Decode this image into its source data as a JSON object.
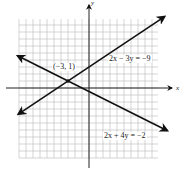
{
  "chart_data": {
    "type": "line",
    "title": "",
    "xlabel": "x",
    "ylabel": "y",
    "grid": true,
    "xlim": [
      -10,
      10
    ],
    "ylim": [
      -10,
      10
    ],
    "series": [
      {
        "name": "2x − 3y = −9",
        "equation": "2x - 3y = -9",
        "slope": 0.6667,
        "intercept": 3
      },
      {
        "name": "2x + 4y = −2",
        "equation": "2x + 4y = -2",
        "slope": -0.5,
        "intercept": -0.5
      }
    ],
    "annotations": [
      {
        "text": "(−3, 1)",
        "x": -3,
        "y": 1,
        "type": "intersection-point"
      }
    ]
  },
  "labels": {
    "x_axis": "x",
    "y_axis": "y",
    "line1": "2x − 3y = −9",
    "line2": "2x + 4y = −2",
    "intersection": "(−3, 1)"
  }
}
